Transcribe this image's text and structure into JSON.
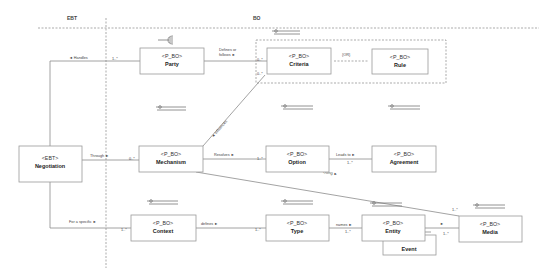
{
  "diagram": {
    "zones": [
      {
        "id": "ebt",
        "label": "EBT",
        "x": 67,
        "y": 18
      },
      {
        "id": "bo",
        "label": "BO",
        "x": 253,
        "y": 18
      }
    ],
    "classes": [
      {
        "id": "party",
        "stereotype": "<P_BO>",
        "name": "Party",
        "x": 140,
        "y": 48,
        "w": 64,
        "h": 26,
        "icon": "fork-icon"
      },
      {
        "id": "criteria",
        "stereotype": "<P_BO>",
        "name": "Criteria",
        "x": 267,
        "y": 48,
        "w": 64,
        "h": 26,
        "icon": "circle-line-icon"
      },
      {
        "id": "rule",
        "stereotype": "<P_BO>",
        "name": "Rule",
        "x": 372,
        "y": 48,
        "w": 56,
        "h": 26,
        "icon": "none"
      },
      {
        "id": "negotiation",
        "stereotype": "<EBT>",
        "name": "Negotiation",
        "x": 19,
        "y": 146,
        "w": 63,
        "h": 36,
        "icon": "none"
      },
      {
        "id": "mechanism",
        "stereotype": "<P_BO>",
        "name": "Mechanism",
        "x": 139,
        "y": 146,
        "w": 64,
        "h": 26,
        "icon": "circle-line-icon"
      },
      {
        "id": "option",
        "stereotype": "<P_BO>",
        "name": "Option",
        "x": 266,
        "y": 146,
        "w": 63,
        "h": 26,
        "icon": "circle-line-icon"
      },
      {
        "id": "agreement",
        "stereotype": "<P_BO>",
        "name": "Agreement",
        "x": 372,
        "y": 146,
        "w": 64,
        "h": 26,
        "icon": "circle-line-icon"
      },
      {
        "id": "context",
        "stereotype": "<P_BO>",
        "name": "Context",
        "x": 131,
        "y": 215,
        "w": 65,
        "h": 26,
        "icon": "circle-line-icon"
      },
      {
        "id": "type",
        "stereotype": "<P_BO>",
        "name": "Type",
        "x": 266,
        "y": 215,
        "w": 63,
        "h": 26,
        "icon": "circle-line-icon"
      },
      {
        "id": "entity",
        "stereotype": "<P_BO>",
        "name": "Entity",
        "x": 362,
        "y": 215,
        "w": 63,
        "h": 26,
        "icon": "circle-line-icon"
      },
      {
        "id": "media",
        "stereotype": "<P_BO>",
        "name": "Media",
        "x": 459,
        "y": 216,
        "w": 63,
        "h": 26,
        "icon": "circle-line-icon"
      }
    ],
    "event_box": {
      "name": "Event",
      "x": 383,
      "y": 241,
      "w": 53,
      "h": 14
    },
    "associations": [
      {
        "id": "handles",
        "label": "◄ Handles",
        "label_x": 69,
        "label_y": 59,
        "mult": "1..*",
        "mult_x": 112,
        "mult_y": 61
      },
      {
        "id": "defines-or-follows",
        "label_line1": "Defines or",
        "label_line2": "follows ►",
        "label_x": 219,
        "label_y": 51,
        "mult": "0..*",
        "mult_x": 257,
        "mult_y": 61
      },
      {
        "id": "criteria-or-rule",
        "label": "{OR}",
        "label_x": 342,
        "label_y": 55
      },
      {
        "id": "influences",
        "label": "◄ influences",
        "mult": "0..*",
        "mult_x": 257,
        "mult_y": 74
      },
      {
        "id": "through",
        "label": "Through ►",
        "label_x": 90,
        "label_y": 156,
        "mult": "0..*",
        "mult_x": 130,
        "mult_y": 160
      },
      {
        "id": "resolves",
        "label": "Resolves ►",
        "label_x": 214,
        "label_y": 156,
        "mult": "1..*",
        "mult_x": 258,
        "mult_y": 160
      },
      {
        "id": "leads-to",
        "label": "Leads to ►",
        "label_x": 336,
        "label_y": 155,
        "mult": "1..*",
        "mult_x": 348,
        "mult_y": 163
      },
      {
        "id": "using",
        "label": "Using ►",
        "label_x": 324,
        "label_y": 174,
        "mult": "1..*",
        "mult_x": 453,
        "mult_y": 212
      },
      {
        "id": "for-a-specific",
        "label": "For a specific ►",
        "label_x": 69,
        "label_y": 223,
        "mult": "1..*",
        "mult_x": 122,
        "mult_y": 230
      },
      {
        "id": "defines",
        "label": "defines ►",
        "label_x": 201,
        "label_y": 225,
        "mult": "1..*",
        "mult_x": 256,
        "mult_y": 230
      },
      {
        "id": "names",
        "label": "names ►",
        "label_x": 336,
        "label_y": 225,
        "mult": "1..*",
        "mult_x": 345,
        "mult_y": 232
      },
      {
        "id": "entity-media",
        "label": "►",
        "label_x": 439,
        "label_y": 225,
        "mult": "1..*",
        "mult_x": 444,
        "mult_y": 234
      }
    ],
    "colors": {
      "box_border": "#9a9a9a",
      "line": "#8c8c8c",
      "dashed": "#888888",
      "text": "#333333",
      "background": "#ffffff"
    }
  }
}
